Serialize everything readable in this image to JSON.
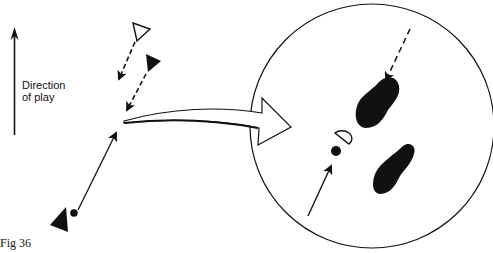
{
  "figure": {
    "caption": "Fig 36",
    "direction_label_line1": "Direction",
    "direction_label_line2": "of play"
  },
  "legend": {
    "hollow_triangle": "opponent/defender (outline)",
    "filled_triangle": "player",
    "dashed_arrow": "player movement",
    "solid_arrow": "ball path",
    "dot": "ball",
    "footprints": "foot positions (enlarged view)"
  },
  "colors": {
    "ink": "#111111",
    "paper": "#ffffff"
  }
}
